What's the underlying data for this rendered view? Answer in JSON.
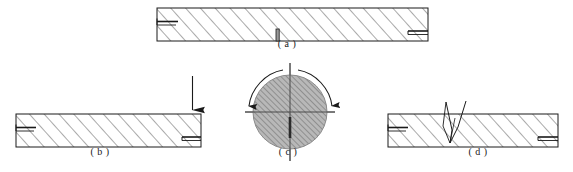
{
  "figure": {
    "width": 573,
    "height": 172,
    "background_color": "#ffffff",
    "line_color": "#1a1a1a",
    "hatch_color": "#555555",
    "circle_fill_color": "#b3b3b3"
  },
  "panels": [
    {
      "id": "a",
      "label": "( a )",
      "label_x": 287,
      "label_y": 44,
      "kind": "hatched-bar",
      "bar": {
        "x": 157,
        "y": 8,
        "width": 271,
        "height": 33
      },
      "features": [
        "left-end-tick-upper",
        "right-end-tick-lower",
        "center-bottom-notch"
      ]
    },
    {
      "id": "b",
      "label": "( b )",
      "label_x": 100,
      "label_y": 150,
      "kind": "hatched-bar-with-load-arrow",
      "bar": {
        "x": 16,
        "y": 114,
        "width": 185,
        "height": 33
      },
      "features": [
        "left-end-tick-upper",
        "right-end-tick-lower",
        "downward-force-arrow"
      ],
      "arrow": {
        "x": 192,
        "y_top": 76,
        "y_bottom": 110
      }
    },
    {
      "id": "c",
      "label": "( c )",
      "label_x": 288,
      "label_y": 150,
      "kind": "hatched-circle",
      "circle": {
        "cx": 290,
        "cy": 112,
        "r": 37
      },
      "features": [
        "vertical-centerline",
        "horizontal-centerline",
        "left-rotation-arrow",
        "right-rotation-arrow"
      ]
    },
    {
      "id": "d",
      "label": "( d )",
      "label_x": 478,
      "label_y": 150,
      "kind": "hatched-bar-with-cracks",
      "bar": {
        "x": 388,
        "y": 114,
        "width": 170,
        "height": 33
      },
      "features": [
        "left-end-tick-upper",
        "right-end-tick-lower",
        "converging-crack-lines"
      ]
    }
  ],
  "labels": {
    "a": "( a )",
    "b": "( b )",
    "c": "( c )",
    "d": "( d )"
  }
}
